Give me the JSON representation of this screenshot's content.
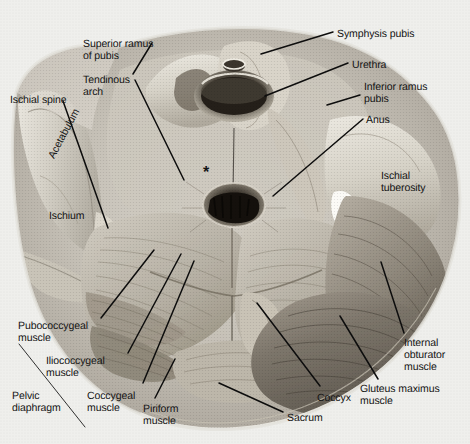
{
  "figure": {
    "background_color": "#efefec",
    "label_color": "#131313",
    "leader_color": "#0d0d0d",
    "marker": {
      "name": "asterisk-marker",
      "glyph": "*",
      "x": 203,
      "y": 168
    }
  },
  "labels": [
    {
      "id": "superior-ramus-of-pubis",
      "text": "Superior ramus\nof pubis",
      "x": 83,
      "y": 38,
      "align": "left",
      "rotation": 0
    },
    {
      "id": "tendinous-arch",
      "text": "Tendinous\narch",
      "x": 83,
      "y": 74,
      "align": "left",
      "rotation": 0
    },
    {
      "id": "ischial-spine",
      "text": "Ischial spine",
      "x": 10,
      "y": 94,
      "align": "left",
      "rotation": 0
    },
    {
      "id": "acetabulum",
      "text": "Acetabulum",
      "x": 46,
      "y": 155,
      "align": "left",
      "rotation": -62
    },
    {
      "id": "ischium",
      "text": "Ischium",
      "x": 49,
      "y": 210,
      "align": "left",
      "rotation": 0
    },
    {
      "id": "symphysis-pubis",
      "text": "Symphysis pubis",
      "x": 337,
      "y": 28,
      "align": "left",
      "rotation": 0
    },
    {
      "id": "urethra",
      "text": "Urethra",
      "x": 352,
      "y": 59,
      "align": "left",
      "rotation": 0
    },
    {
      "id": "inferior-ramus-pubis",
      "text": "Inferior ramus\npubis",
      "x": 364,
      "y": 81,
      "align": "left",
      "rotation": 0
    },
    {
      "id": "anus",
      "text": "Anus",
      "x": 366,
      "y": 114,
      "align": "left",
      "rotation": 0
    },
    {
      "id": "ischial-tuberosity",
      "text": "Ischial\ntuberosity",
      "x": 381,
      "y": 170,
      "align": "left",
      "rotation": 0
    },
    {
      "id": "pubococcygeal-muscle",
      "text": "Pubococcygeal\nmuscle",
      "x": 18,
      "y": 320,
      "align": "left",
      "rotation": 0
    },
    {
      "id": "iliococcygeal-muscle",
      "text": "Iliococcygeal\nmuscle",
      "x": 46,
      "y": 355,
      "align": "left",
      "rotation": 0
    },
    {
      "id": "pelvic-diaphragm",
      "text": "Pelvic\ndiaphragm",
      "x": 12,
      "y": 390,
      "align": "left",
      "rotation": 0
    },
    {
      "id": "coccygeal-muscle",
      "text": "Coccygeal\nmuscle",
      "x": 87,
      "y": 390,
      "align": "left",
      "rotation": 0
    },
    {
      "id": "piriform-muscle",
      "text": "Piriform\nmuscle",
      "x": 143,
      "y": 403,
      "align": "left",
      "rotation": 0
    },
    {
      "id": "sacrum",
      "text": "Sacrum",
      "x": 287,
      "y": 412,
      "align": "left",
      "rotation": 0
    },
    {
      "id": "coccyx",
      "text": "Coccyx",
      "x": 317,
      "y": 392,
      "align": "left",
      "rotation": 0
    },
    {
      "id": "gluteus-maximus-muscle",
      "text": "Gluteus maximus\nmuscle",
      "x": 360,
      "y": 383,
      "align": "left",
      "rotation": 0
    },
    {
      "id": "internal-obturator-muscle",
      "text": "Internal\nobturator\nmuscle",
      "x": 404,
      "y": 337,
      "align": "left",
      "rotation": 0
    }
  ],
  "leaders": [
    {
      "id": "leader-superior-ramus-of-pubis",
      "x1": 152,
      "y1": 43,
      "x2": 133,
      "y2": 74
    },
    {
      "id": "leader-tendinous-arch",
      "x1": 135,
      "y1": 80,
      "x2": 184,
      "y2": 180
    },
    {
      "id": "leader-ischial-spine",
      "x1": 63,
      "y1": 101,
      "x2": 108,
      "y2": 228
    },
    {
      "id": "leader-symphysis-pubis",
      "x1": 333,
      "y1": 32,
      "x2": 261,
      "y2": 54
    },
    {
      "id": "leader-urethra",
      "x1": 348,
      "y1": 63,
      "x2": 265,
      "y2": 96
    },
    {
      "id": "leader-inferior-ramus-pubis",
      "x1": 360,
      "y1": 95,
      "x2": 327,
      "y2": 105
    },
    {
      "id": "leader-anus",
      "x1": 363,
      "y1": 119,
      "x2": 273,
      "y2": 196
    },
    {
      "id": "leader-pubococcygeal-muscle",
      "x1": 101,
      "y1": 318,
      "x2": 154,
      "y2": 250
    },
    {
      "id": "leader-iliococcygeal-muscle",
      "x1": 128,
      "y1": 353,
      "x2": 181,
      "y2": 254
    },
    {
      "id": "leader-coccygeal-muscle",
      "x1": 143,
      "y1": 383,
      "x2": 194,
      "y2": 261
    },
    {
      "id": "leader-piriform-muscle",
      "x1": 155,
      "y1": 398,
      "x2": 175,
      "y2": 359
    },
    {
      "id": "leader-sacrum",
      "x1": 283,
      "y1": 412,
      "x2": 219,
      "y2": 383
    },
    {
      "id": "leader-coccyx",
      "x1": 320,
      "y1": 386,
      "x2": 257,
      "y2": 303
    },
    {
      "id": "leader-gluteus-maximus-muscle",
      "x1": 378,
      "y1": 379,
      "x2": 340,
      "y2": 316
    },
    {
      "id": "leader-internal-obturator-muscle",
      "x1": 404,
      "y1": 333,
      "x2": 381,
      "y2": 262
    }
  ],
  "brackets": [
    {
      "id": "bracket-pelvic-diaphragm",
      "x1": 19,
      "y1": 344,
      "x2": 85,
      "y2": 427
    }
  ]
}
